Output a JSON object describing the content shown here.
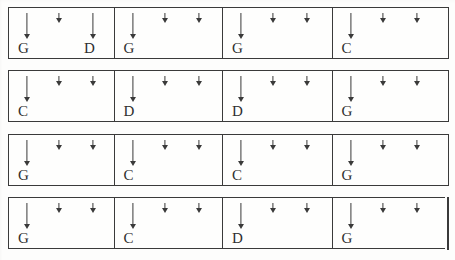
{
  "document": {
    "kind": "guitar-strumming-chord-chart",
    "rows": 4,
    "measures_per_row": 4,
    "ink_color": "#3a3a3a",
    "text_color": "#2f2f2f",
    "paper_color": "#fdfdfc"
  },
  "legend": {
    "long_arrow": "down-strum-long",
    "short_arrow": "down-strum-short",
    "barline": "barline",
    "final_barline": "final-double-barline"
  },
  "systems": [
    {
      "index": 1,
      "final": false,
      "measures": [
        {
          "index": 1,
          "strums": [
            "long",
            "short",
            "long"
          ],
          "chords": [
            {
              "slot": 0,
              "label": "G"
            },
            {
              "slot": 2,
              "label": "D"
            }
          ]
        },
        {
          "index": 2,
          "strums": [
            "long",
            "short",
            "short"
          ],
          "chords": [
            {
              "slot": 0,
              "label": "G"
            }
          ]
        },
        {
          "index": 3,
          "strums": [
            "long",
            "short",
            "short"
          ],
          "chords": [
            {
              "slot": 0,
              "label": "G"
            }
          ]
        },
        {
          "index": 4,
          "strums": [
            "long",
            "short",
            "short"
          ],
          "chords": [
            {
              "slot": 0,
              "label": "C"
            }
          ]
        }
      ]
    },
    {
      "index": 2,
      "final": false,
      "measures": [
        {
          "index": 1,
          "strums": [
            "long",
            "short",
            "short"
          ],
          "chords": [
            {
              "slot": 0,
              "label": "C"
            }
          ]
        },
        {
          "index": 2,
          "strums": [
            "long",
            "short",
            "short"
          ],
          "chords": [
            {
              "slot": 0,
              "label": "D"
            }
          ]
        },
        {
          "index": 3,
          "strums": [
            "long",
            "short",
            "short"
          ],
          "chords": [
            {
              "slot": 0,
              "label": "D"
            }
          ]
        },
        {
          "index": 4,
          "strums": [
            "long",
            "short",
            "short"
          ],
          "chords": [
            {
              "slot": 0,
              "label": "G"
            }
          ]
        }
      ]
    },
    {
      "index": 3,
      "final": false,
      "measures": [
        {
          "index": 1,
          "strums": [
            "long",
            "short",
            "short"
          ],
          "chords": [
            {
              "slot": 0,
              "label": "G"
            }
          ]
        },
        {
          "index": 2,
          "strums": [
            "long",
            "short",
            "short"
          ],
          "chords": [
            {
              "slot": 0,
              "label": "C"
            }
          ]
        },
        {
          "index": 3,
          "strums": [
            "long",
            "short",
            "short"
          ],
          "chords": [
            {
              "slot": 0,
              "label": "C"
            }
          ]
        },
        {
          "index": 4,
          "strums": [
            "long",
            "short",
            "short"
          ],
          "chords": [
            {
              "slot": 0,
              "label": "G"
            }
          ]
        }
      ]
    },
    {
      "index": 4,
      "final": true,
      "measures": [
        {
          "index": 1,
          "strums": [
            "long",
            "short",
            "short"
          ],
          "chords": [
            {
              "slot": 0,
              "label": "G"
            }
          ]
        },
        {
          "index": 2,
          "strums": [
            "long",
            "short",
            "short"
          ],
          "chords": [
            {
              "slot": 0,
              "label": "C"
            }
          ]
        },
        {
          "index": 3,
          "strums": [
            "long",
            "short",
            "short"
          ],
          "chords": [
            {
              "slot": 0,
              "label": "D"
            }
          ]
        },
        {
          "index": 4,
          "strums": [
            "long",
            "short",
            "short"
          ],
          "chords": [
            {
              "slot": 0,
              "label": "G"
            }
          ]
        }
      ]
    }
  ]
}
